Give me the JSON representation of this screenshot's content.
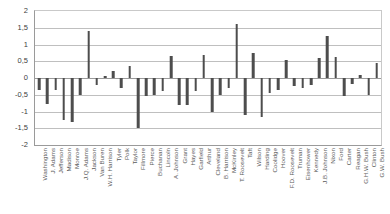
{
  "chart_data": {
    "type": "bar",
    "title": "",
    "subtitle": "",
    "xlabel": "",
    "ylabel": "",
    "ylim": [
      -2,
      2
    ],
    "grid": true,
    "legend": "none",
    "decimal_separator": ",",
    "ytick_labels": [
      "2",
      "1,5",
      "1",
      "0,5",
      "0",
      "-0,5",
      "-1",
      "-1,5",
      "-2"
    ],
    "ytick_values": [
      2,
      1.5,
      1,
      0.5,
      0,
      -0.5,
      -1,
      -1.5,
      -2
    ],
    "bar_color": "#4d4d4d",
    "categories": [
      "Washington",
      "J. Adams",
      "Jefferson",
      "Madison",
      "Monroe",
      "J.Q. Adams",
      "Jackson",
      "Van Buren",
      "W.H. Harrison",
      "Tyler",
      "Polk",
      "Taylor",
      "Fillmore",
      "Pierce",
      "Buchanan",
      "Lincoln",
      "A. Johnson",
      "Grant",
      "Hayes",
      "Garfield",
      "Arthur",
      "Cleveland",
      "B. Harrison",
      "McKinley",
      "T. Roosevelt",
      "Taft",
      "Wilson",
      "Harding",
      "Coolidge",
      "Hoover",
      "F.D. Roosevelt",
      "Truman",
      "Eisenhower",
      "Kennedy",
      "J.B. Johnson",
      "Nixon",
      "Ford",
      "Carter",
      "Reagan",
      "G.H.W. Bush",
      "Clinton",
      "G.W. Bush"
    ],
    "values": [
      -0.35,
      -0.78,
      -0.35,
      -1.25,
      -1.32,
      -0.5,
      1.4,
      -0.22,
      0.05,
      0.2,
      -0.3,
      0.35,
      -1.5,
      -0.55,
      -0.5,
      -0.4,
      0.65,
      -0.8,
      -0.8,
      -0.4,
      0.7,
      -1.0,
      -0.5,
      -0.3,
      1.6,
      -1.1,
      0.75,
      -1.15,
      -0.45,
      -0.35,
      0.55,
      -0.25,
      -0.3,
      -0.22,
      0.6,
      1.25,
      0.62,
      -0.55,
      -0.18,
      0.1,
      -0.5,
      0.45
    ]
  }
}
